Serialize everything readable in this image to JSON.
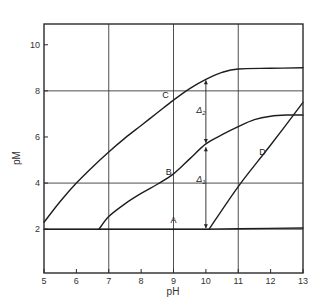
{
  "chart_data": {
    "type": "line",
    "title": "",
    "xlabel": "pH",
    "ylabel": "pM",
    "xlim": [
      5,
      13
    ],
    "ylim": [
      0.1,
      10.9
    ],
    "xticks": [
      5,
      6,
      7,
      8,
      9,
      10,
      11,
      12,
      13
    ],
    "yticks": [
      2,
      4,
      6,
      8,
      10
    ],
    "grid": {
      "vertical": [
        7,
        9,
        11
      ],
      "horizontal": [
        2,
        4,
        8
      ]
    },
    "legend": "none (curves labeled inline)",
    "series": [
      {
        "name": "A",
        "x": [
          5,
          7,
          9,
          10,
          11,
          13
        ],
        "y": [
          2.0,
          2.0,
          2.0,
          2.0,
          2.02,
          2.05
        ],
        "label_at": [
          9.0,
          2.25
        ]
      },
      {
        "name": "B",
        "x": [
          6.7,
          7,
          7.5,
          8,
          8.5,
          9,
          9.5,
          10,
          10.5,
          11,
          11.5,
          12,
          12.5,
          13
        ],
        "y": [
          2.0,
          2.55,
          3.1,
          3.55,
          3.95,
          4.4,
          5.05,
          5.7,
          6.1,
          6.45,
          6.75,
          6.9,
          6.95,
          6.95
        ],
        "label_at": [
          8.85,
          4.35
        ]
      },
      {
        "name": "C",
        "x": [
          5,
          5.5,
          6,
          6.5,
          7,
          7.5,
          8,
          8.5,
          9,
          9.5,
          10,
          10.5,
          11,
          12,
          13
        ],
        "y": [
          2.3,
          3.2,
          4.0,
          4.7,
          5.35,
          5.95,
          6.5,
          7.05,
          7.6,
          8.1,
          8.5,
          8.8,
          8.95,
          8.98,
          9.0
        ],
        "label_at": [
          8.75,
          7.7
        ]
      },
      {
        "name": "D",
        "x": [
          10.1,
          11,
          12,
          13
        ],
        "y": [
          2.0,
          3.85,
          5.65,
          7.5
        ],
        "label_at": [
          11.75,
          5.2
        ]
      }
    ],
    "annotations": [
      {
        "label": "Δ2",
        "x": 10,
        "from": 5.7,
        "to": 8.5,
        "text_at": [
          9.85,
          7.05
        ]
      },
      {
        "label": "Δ1",
        "x": 10,
        "from": 2.0,
        "to": 5.6,
        "text_at": [
          9.85,
          4.05
        ]
      }
    ]
  }
}
